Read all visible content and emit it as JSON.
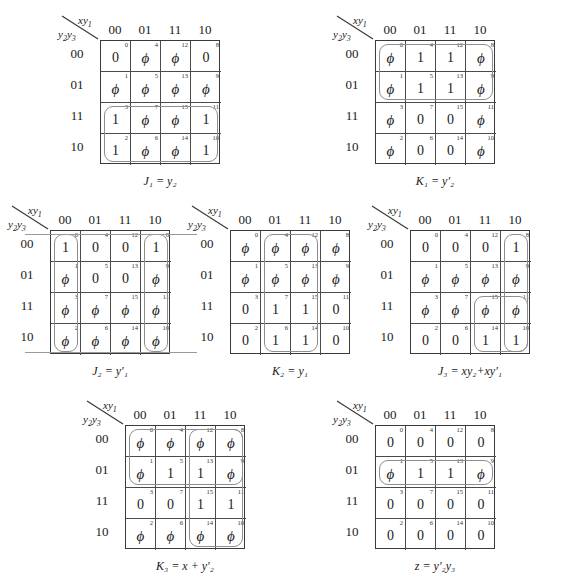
{
  "figure": {
    "type": "karnaugh-map-set",
    "map_count": 7,
    "grid": {
      "columns": [
        "00",
        "01",
        "11",
        "10"
      ],
      "rows": [
        "00",
        "01",
        "11",
        "10"
      ],
      "top_variable_label": "xy1",
      "left_variable_label": "y2y3",
      "cell_indices": [
        [
          0,
          4,
          12,
          8
        ],
        [
          1,
          5,
          13,
          9
        ],
        [
          3,
          7,
          15,
          11
        ],
        [
          2,
          6,
          14,
          10
        ]
      ]
    }
  },
  "maps": [
    {
      "id": "J1",
      "caption": {
        "lhs": "J",
        "lhs_sub": "1",
        "eq": "=",
        "rhs": "y",
        "rhs_sub": "2",
        "rhs_prime": "",
        "full": "J1 = y2"
      },
      "top_label": {
        "main": "xy",
        "sub": "1"
      },
      "left_label": {
        "main": "y",
        "sub": "2",
        "main2": "y",
        "sub2": "3"
      },
      "cells": [
        [
          "0",
          "ϕ",
          "ϕ",
          "0"
        ],
        [
          "ϕ",
          "ϕ",
          "ϕ",
          "ϕ"
        ],
        [
          "1",
          "ϕ",
          "ϕ",
          "1"
        ],
        [
          "1",
          "ϕ",
          "ϕ",
          "1"
        ]
      ],
      "loops": [
        {
          "name": "loop-rows-11-10",
          "col": 0,
          "row": 2,
          "cols": 4,
          "rows": 2
        }
      ],
      "wraplines": []
    },
    {
      "id": "K1",
      "caption": {
        "lhs": "K",
        "lhs_sub": "1",
        "eq": "=",
        "rhs": "y",
        "rhs_sub": "2",
        "rhs_prime": "′",
        "full": "K1 = y2'"
      },
      "top_label": {
        "main": "xy",
        "sub": "1"
      },
      "left_label": {
        "main": "y",
        "sub": "2",
        "main2": "y",
        "sub2": "3"
      },
      "cells": [
        [
          "ϕ",
          "1",
          "1",
          "ϕ"
        ],
        [
          "ϕ",
          "1",
          "1",
          "ϕ"
        ],
        [
          "ϕ",
          "0",
          "0",
          "ϕ"
        ],
        [
          "ϕ",
          "0",
          "0",
          "ϕ"
        ]
      ],
      "loops": [
        {
          "name": "loop-rows-00-01",
          "col": 0,
          "row": 0,
          "cols": 4,
          "rows": 2
        }
      ],
      "wraplines": []
    },
    {
      "id": "J2",
      "caption": {
        "lhs": "J",
        "lhs_sub": "2",
        "eq": "=",
        "rhs": "y",
        "rhs_sub": "1",
        "rhs_prime": "′",
        "full": "J2 = y1'"
      },
      "top_label": {
        "main": "xy",
        "sub": "1"
      },
      "left_label": {
        "main": "y",
        "sub": "2",
        "main2": "y",
        "sub2": "3"
      },
      "cells": [
        [
          "1",
          "0",
          "0",
          "1"
        ],
        [
          "ϕ",
          "0",
          "0",
          "ϕ"
        ],
        [
          "ϕ",
          "ϕ",
          "ϕ",
          "ϕ"
        ],
        [
          "ϕ",
          "ϕ",
          "ϕ",
          "ϕ"
        ]
      ],
      "loops": [
        {
          "name": "loop-col-00",
          "col": 0,
          "row": 0,
          "cols": 1,
          "rows": 4
        },
        {
          "name": "loop-col-10",
          "col": 3,
          "row": 0,
          "cols": 1,
          "rows": 4
        }
      ],
      "wraplines": [
        {
          "name": "wrapline-top",
          "side": "top"
        },
        {
          "name": "wrapline-bottom",
          "side": "bottom"
        }
      ]
    },
    {
      "id": "K2",
      "caption": {
        "lhs": "K",
        "lhs_sub": "2",
        "eq": "=",
        "rhs": "y",
        "rhs_sub": "1",
        "rhs_prime": "",
        "full": "K2 = y1"
      },
      "top_label": {
        "main": "xy",
        "sub": "1"
      },
      "left_label": {
        "main": "y",
        "sub": "2",
        "main2": "y",
        "sub2": "3"
      },
      "cells": [
        [
          "ϕ",
          "ϕ",
          "ϕ",
          "ϕ"
        ],
        [
          "ϕ",
          "ϕ",
          "ϕ",
          "ϕ"
        ],
        [
          "0",
          "1",
          "1",
          "0"
        ],
        [
          "0",
          "1",
          "1",
          "0"
        ]
      ],
      "loops": [
        {
          "name": "loop-cols-01-11",
          "col": 1,
          "row": 0,
          "cols": 2,
          "rows": 4
        }
      ],
      "wraplines": []
    },
    {
      "id": "J3",
      "caption": {
        "lhs": "J",
        "lhs_sub": "3",
        "eq": "=",
        "rhs": "xy",
        "rhs_sub": "2",
        "rhs_prime": "",
        "full": "J3 = xy2 + xy1'"
      },
      "top_label": {
        "main": "xy",
        "sub": "1"
      },
      "left_label": {
        "main": "y",
        "sub": "2",
        "main2": "y",
        "sub2": "3"
      },
      "cells": [
        [
          "0",
          "0",
          "0",
          "1"
        ],
        [
          "ϕ",
          "ϕ",
          "ϕ",
          "ϕ"
        ],
        [
          "ϕ",
          "ϕ",
          "ϕ",
          "ϕ"
        ],
        [
          "0",
          "0",
          "1",
          "1"
        ]
      ],
      "loops": [
        {
          "name": "loop-col-10",
          "col": 3,
          "row": 0,
          "cols": 1,
          "rows": 4
        },
        {
          "name": "loop-cols-11-10-rows-11-10",
          "col": 2,
          "row": 2,
          "cols": 2,
          "rows": 2
        }
      ],
      "wraplines": []
    },
    {
      "id": "K3",
      "caption": {
        "lhs": "K",
        "lhs_sub": "3",
        "eq": "=",
        "rhs": "x",
        "rhs_sub": "",
        "rhs_prime": "",
        "full": "K3 = x + y2'"
      },
      "top_label": {
        "main": "xy",
        "sub": "1"
      },
      "left_label": {
        "main": "y",
        "sub": "2",
        "main2": "y",
        "sub2": "3"
      },
      "cells": [
        [
          "ϕ",
          "ϕ",
          "ϕ",
          "ϕ"
        ],
        [
          "ϕ",
          "1",
          "1",
          "ϕ"
        ],
        [
          "0",
          "0",
          "1",
          "1"
        ],
        [
          "ϕ",
          "ϕ",
          "ϕ",
          "ϕ"
        ]
      ],
      "loops": [
        {
          "name": "loop-rows-00-01",
          "col": 0,
          "row": 0,
          "cols": 4,
          "rows": 2
        },
        {
          "name": "loop-cols-11-10",
          "col": 2,
          "row": 0,
          "cols": 2,
          "rows": 4
        }
      ],
      "wraplines": []
    },
    {
      "id": "z",
      "caption": {
        "lhs": "z",
        "lhs_sub": "",
        "eq": "=",
        "rhs": "y",
        "rhs_sub": "2",
        "rhs_prime": "′",
        "full": "z = y2'y3"
      },
      "top_label": {
        "main": "xy",
        "sub": "1"
      },
      "left_label": {
        "main": "y",
        "sub": "2",
        "main2": "y",
        "sub2": "3"
      },
      "cells": [
        [
          "0",
          "0",
          "0",
          "0"
        ],
        [
          "ϕ",
          "1",
          "1",
          "ϕ"
        ],
        [
          "0",
          "0",
          "0",
          "0"
        ],
        [
          "0",
          "0",
          "0",
          "0"
        ]
      ],
      "loops": [
        {
          "name": "loop-row-01",
          "col": 0,
          "row": 1,
          "cols": 4,
          "rows": 1
        }
      ],
      "wraplines": []
    }
  ],
  "captions": {
    "J1": "J₁ = y₂",
    "K1": "K₁ = y′₂",
    "J2": "J₂ = y′₁",
    "K2": "K₂ = y₁",
    "J3": "J₃ = xy₂+xy′₁",
    "K3": "K₃ = x + y′₂",
    "z": "z = y′₂y₃"
  },
  "layout": {
    "positions": [
      {
        "id": "J1",
        "x": 58,
        "y": 14
      },
      {
        "id": "K1",
        "x": 333,
        "y": 14
      },
      {
        "id": "J2",
        "x": 8,
        "y": 204
      },
      {
        "id": "K2",
        "x": 188,
        "y": 204
      },
      {
        "id": "J3",
        "x": 368,
        "y": 204
      },
      {
        "id": "K3",
        "x": 83,
        "y": 399
      },
      {
        "id": "z",
        "x": 333,
        "y": 399
      }
    ]
  },
  "colors": {
    "grid_line": "#4a4a4a",
    "grid_border": "#3a3a3a",
    "loop": "#8e8e8e",
    "text": "#1a1a1a",
    "background": "#ffffff"
  }
}
